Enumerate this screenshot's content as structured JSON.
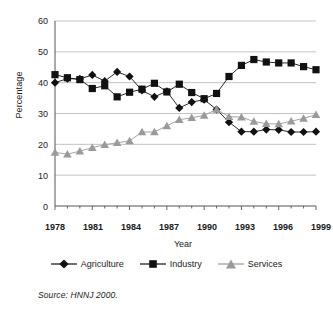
{
  "chart_data": {
    "type": "line",
    "title": "",
    "xlabel": "Year",
    "ylabel": "Percentage",
    "xlim": [
      1978,
      1999
    ],
    "ylim": [
      0,
      60
    ],
    "ytick_step": 10,
    "yticks": [
      "0",
      "10",
      "20",
      "30",
      "40",
      "50",
      "60"
    ],
    "xticks": [
      "1978",
      "1981",
      "1984",
      "1987",
      "1990",
      "1993",
      "1996",
      "1999"
    ],
    "grid": "horizontal",
    "legend_position": "bottom",
    "x": [
      1978,
      1979,
      1980,
      1981,
      1982,
      1983,
      1984,
      1985,
      1986,
      1987,
      1988,
      1989,
      1990,
      1991,
      1992,
      1993,
      1994,
      1995,
      1996,
      1997,
      1998,
      1999
    ],
    "series": [
      {
        "name": "Agriculture",
        "marker": "diamond",
        "color": "#111111",
        "values": [
          40.0,
          41.3,
          41.2,
          42.5,
          40.5,
          43.5,
          42.0,
          37.5,
          35.4,
          37.2,
          31.8,
          33.7,
          34.5,
          31.3,
          27.2,
          24.1,
          24.1,
          24.8,
          24.7,
          24.0,
          24.0,
          24.1
        ]
      },
      {
        "name": "Industry",
        "marker": "square",
        "color": "#111111",
        "values": [
          42.6,
          41.6,
          41.0,
          38.1,
          39.0,
          35.4,
          36.9,
          37.9,
          39.8,
          37.0,
          39.5,
          36.8,
          34.8,
          36.5,
          42.0,
          45.6,
          47.5,
          46.7,
          46.4,
          46.4,
          45.2,
          44.2
        ]
      },
      {
        "name": "Services",
        "marker": "triangle",
        "color": "#9a9a9a",
        "values": [
          17.4,
          16.8,
          17.8,
          18.9,
          19.9,
          20.5,
          21.1,
          24.0,
          24.0,
          26.0,
          28.0,
          28.6,
          29.4,
          31.3,
          29.0,
          28.8,
          27.4,
          26.7,
          26.6,
          27.5,
          28.4,
          29.6
        ]
      }
    ],
    "annotations": {
      "source": "Source:  HNNJ 2000."
    }
  },
  "legend": {
    "items": [
      {
        "label": "Agriculture"
      },
      {
        "label": "Industry"
      },
      {
        "label": "Services"
      }
    ]
  }
}
